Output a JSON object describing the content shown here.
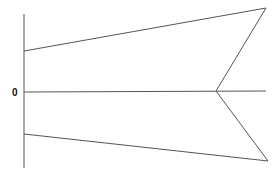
{
  "diagram": {
    "type": "geometric-figure",
    "stroke_color": "#555555",
    "background": "#ffffff",
    "origin_label": "0",
    "axis": {
      "x1": 24,
      "y1": 14,
      "x2": 24,
      "y2": 168
    },
    "segments": [
      {
        "name": "upper-edge",
        "x1": 24,
        "y1": 51,
        "x2": 266,
        "y2": 8
      },
      {
        "name": "upper-inner-edge",
        "x1": 266,
        "y1": 8,
        "x2": 216,
        "y2": 91
      },
      {
        "name": "center-line",
        "x1": 24,
        "y1": 92,
        "x2": 266,
        "y2": 91
      },
      {
        "name": "lower-inner-edge",
        "x1": 216,
        "y1": 91,
        "x2": 268,
        "y2": 161
      },
      {
        "name": "lower-edge",
        "x1": 24,
        "y1": 134,
        "x2": 268,
        "y2": 161
      }
    ]
  }
}
